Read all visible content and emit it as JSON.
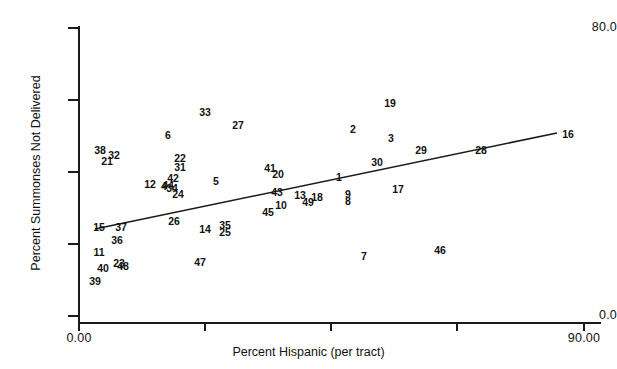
{
  "chart_data": {
    "type": "scatter",
    "title": "",
    "xlabel": "Percent Hispanic (per tract)",
    "ylabel": "Percent Summonses Not Delivered",
    "xlim": [
      0,
      90
    ],
    "ylim": [
      0,
      80
    ],
    "grid": false,
    "legend": "none",
    "xticks": [
      {
        "value": 0,
        "label": "0.00",
        "px": 79
      },
      {
        "value": 22.5,
        "label": "",
        "px": 205
      },
      {
        "value": 45,
        "label": "",
        "px": 331
      },
      {
        "value": 67.5,
        "label": "",
        "px": 457
      },
      {
        "value": 90,
        "label": "90.00",
        "px": 584
      }
    ],
    "yticks": [
      {
        "value": 80,
        "label": "80.0",
        "px": 28
      },
      {
        "value": 60,
        "label": "",
        "px": 100
      },
      {
        "value": 40,
        "label": "",
        "px": 172
      },
      {
        "value": 20,
        "label": "",
        "px": 244
      },
      {
        "value": 0,
        "label": "0.0",
        "px": 316
      }
    ],
    "marker_style": "numeric-case-label",
    "trendline": {
      "label": "regression-line",
      "x_start": 1.2,
      "y_start": 25.5,
      "x_end": 85.5,
      "y_end": 51.5,
      "px": {
        "x1": 95,
        "y1": 229,
        "x2": 557,
        "y2": 133
      }
    },
    "points": [
      {
        "label": "38",
        "x": 3.0,
        "y": 41.2,
        "px": 100,
        "py": 150
      },
      {
        "label": "32",
        "x": 5.5,
        "y": 40.0,
        "px": 114,
        "py": 155
      },
      {
        "label": "21",
        "x": 4.2,
        "y": 38.4,
        "px": 107,
        "py": 161
      },
      {
        "label": "6",
        "x": 15.0,
        "y": 47.8,
        "px": 168,
        "py": 135
      },
      {
        "label": "33",
        "x": 22.0,
        "y": 52.5,
        "px": 205,
        "py": 112
      },
      {
        "label": "27",
        "x": 28.5,
        "y": 50.2,
        "px": 238,
        "py": 125
      },
      {
        "label": "22",
        "x": 16.4,
        "y": 39.8,
        "px": 180,
        "py": 158
      },
      {
        "label": "31",
        "x": 16.4,
        "y": 38.0,
        "px": 180,
        "py": 167
      },
      {
        "label": "12",
        "x": 11.6,
        "y": 35.0,
        "px": 150,
        "py": 184
      },
      {
        "label": "42",
        "x": 16.2,
        "y": 36.2,
        "px": 173,
        "py": 178
      },
      {
        "label": "44",
        "x": 15.2,
        "y": 34.6,
        "px": 168,
        "py": 185
      },
      {
        "label": "4",
        "x": 14.6,
        "y": 34.6,
        "px": 164,
        "py": 186
      },
      {
        "label": "34",
        "x": 16.0,
        "y": 34.2,
        "px": 172,
        "py": 188
      },
      {
        "label": "24",
        "x": 17.1,
        "y": 32.5,
        "px": 178,
        "py": 194
      },
      {
        "label": "5",
        "x": 24.0,
        "y": 35.6,
        "px": 216,
        "py": 181
      },
      {
        "label": "41",
        "x": 38.0,
        "y": 36.8,
        "px": 270,
        "py": 168
      },
      {
        "label": "20",
        "x": 39.5,
        "y": 35.5,
        "px": 278,
        "py": 174
      },
      {
        "label": "43",
        "x": 38.5,
        "y": 32.5,
        "px": 277,
        "py": 192
      },
      {
        "label": "13",
        "x": 42.8,
        "y": 32.0,
        "px": 300,
        "py": 195
      },
      {
        "label": "1",
        "x": 50.5,
        "y": 35.0,
        "px": 339,
        "py": 177
      },
      {
        "label": "18",
        "x": 46.0,
        "y": 31.0,
        "px": 317,
        "py": 197
      },
      {
        "label": "49",
        "x": 44.5,
        "y": 29.8,
        "px": 308,
        "py": 202
      },
      {
        "label": "9",
        "x": 53.0,
        "y": 31.2,
        "px": 348,
        "py": 194
      },
      {
        "label": "8",
        "x": 53.0,
        "y": 29.8,
        "px": 348,
        "py": 201
      },
      {
        "label": "10",
        "x": 39.8,
        "y": 29.8,
        "px": 281,
        "py": 205
      },
      {
        "label": "45",
        "x": 37.0,
        "y": 28.2,
        "px": 268,
        "py": 212
      },
      {
        "label": "17",
        "x": 58.8,
        "y": 32.0,
        "px": 398,
        "py": 189
      },
      {
        "label": "30",
        "x": 56.5,
        "y": 38.2,
        "px": 377,
        "py": 162
      },
      {
        "label": "2",
        "x": 52.5,
        "y": 45.5,
        "px": 353,
        "py": 129
      },
      {
        "label": "3",
        "x": 58.5,
        "y": 44.2,
        "px": 391,
        "py": 138
      },
      {
        "label": "19",
        "x": 57.0,
        "y": 51.0,
        "px": 390,
        "py": 103
      },
      {
        "label": "29",
        "x": 64.5,
        "y": 38.8,
        "px": 421,
        "py": 150
      },
      {
        "label": "28",
        "x": 73.5,
        "y": 39.5,
        "px": 481,
        "py": 150
      },
      {
        "label": "16",
        "x": 87.5,
        "y": 44.8,
        "px": 568,
        "py": 134
      },
      {
        "label": "15",
        "x": 2.0,
        "y": 24.8,
        "px": 99,
        "py": 227
      },
      {
        "label": "37",
        "x": 5.8,
        "y": 24.8,
        "px": 121,
        "py": 227
      },
      {
        "label": "26",
        "x": 15.0,
        "y": 26.5,
        "px": 174,
        "py": 221
      },
      {
        "label": "14",
        "x": 22.0,
        "y": 24.5,
        "px": 205,
        "py": 229
      },
      {
        "label": "35",
        "x": 25.8,
        "y": 25.0,
        "px": 225,
        "py": 225
      },
      {
        "label": "25",
        "x": 25.8,
        "y": 23.5,
        "px": 225,
        "py": 232
      },
      {
        "label": "36",
        "x": 5.0,
        "y": 22.0,
        "px": 117,
        "py": 240
      },
      {
        "label": "11",
        "x": 1.8,
        "y": 19.2,
        "px": 99,
        "py": 252
      },
      {
        "label": "23",
        "x": 5.0,
        "y": 16.8,
        "px": 119,
        "py": 263
      },
      {
        "label": "48",
        "x": 5.8,
        "y": 16.0,
        "px": 123,
        "py": 266
      },
      {
        "label": "40",
        "x": 1.8,
        "y": 15.5,
        "px": 103,
        "py": 268
      },
      {
        "label": "39",
        "x": 0.8,
        "y": 13.0,
        "px": 95,
        "py": 281
      },
      {
        "label": "47",
        "x": 22.0,
        "y": 16.0,
        "px": 200,
        "py": 262
      },
      {
        "label": "7",
        "x": 55.0,
        "y": 15.0,
        "px": 364,
        "py": 256
      },
      {
        "label": "46",
        "x": 72.0,
        "y": 17.0,
        "px": 440,
        "py": 250
      }
    ]
  },
  "colors": {
    "axis": "#1a1a1a",
    "text": "#111111",
    "line": "#1a1a1a",
    "background": "#ffffff"
  }
}
